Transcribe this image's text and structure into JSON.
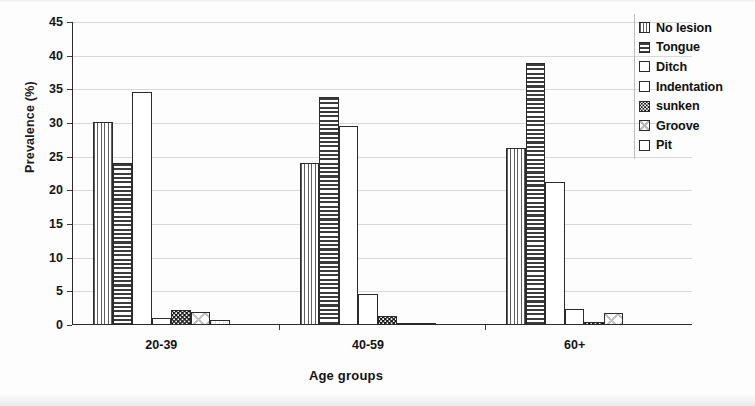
{
  "chart_data": {
    "type": "bar",
    "title": "",
    "xlabel": "Age groups",
    "ylabel": "Prevalence (%)",
    "categories": [
      "20-39",
      "40-59",
      "60+"
    ],
    "ylim": [
      0,
      45
    ],
    "yticks": [
      0,
      5,
      10,
      15,
      20,
      25,
      30,
      35,
      40,
      45
    ],
    "ytick_labels": [
      "0",
      "5",
      "10",
      "15",
      "20",
      "25",
      "30",
      "35",
      "40",
      "45"
    ],
    "grid": true,
    "legend_position": "right",
    "series": [
      {
        "name": "No lesion",
        "pattern": "vertical-lines",
        "values": [
          30.2,
          24.1,
          26.3
        ]
      },
      {
        "name": "Tongue",
        "pattern": "horizontal-lines",
        "values": [
          24.0,
          33.9,
          38.9
        ]
      },
      {
        "name": "Ditch",
        "pattern": "plain",
        "values": [
          34.6,
          29.5,
          21.2
        ]
      },
      {
        "name": "Indentation",
        "pattern": "plain",
        "values": [
          1.0,
          4.6,
          2.4
        ]
      },
      {
        "name": "sunken",
        "pattern": "speckle",
        "values": [
          2.3,
          1.3,
          0.4
        ]
      },
      {
        "name": "Groove",
        "pattern": "cross-hatch",
        "values": [
          2.0,
          0.3,
          1.8
        ]
      },
      {
        "name": "Pit",
        "pattern": "faint",
        "values": [
          0.8,
          0.2,
          0.0
        ]
      }
    ]
  },
  "legend": {
    "items": [
      {
        "label": "No lesion"
      },
      {
        "label": "Tongue"
      },
      {
        "label": "Ditch"
      },
      {
        "label": "Indentation"
      },
      {
        "label": "sunken"
      },
      {
        "label": "Groove"
      },
      {
        "label": "Pit"
      }
    ]
  }
}
